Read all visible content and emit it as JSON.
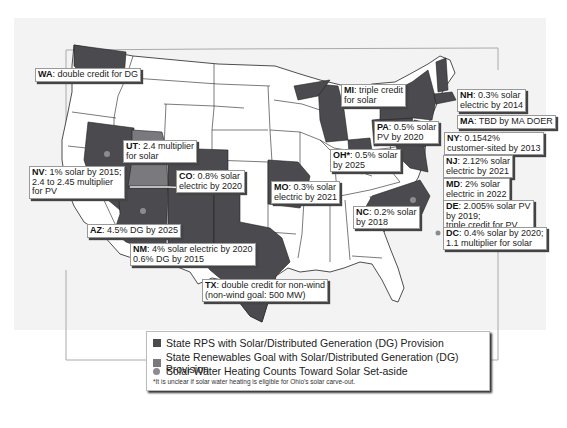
{
  "colors": {
    "rps": "#4a4a4f",
    "goal": "#7a7a7e",
    "swh_dot": "#8c8c90",
    "state_fill": "#ffffff",
    "background": "#f3f3f3"
  },
  "labels": {
    "wa": {
      "code": "WA",
      "text": ": double credit for DG"
    },
    "mi": {
      "code": "MI",
      "text": ": triple credit",
      "text2": "for solar"
    },
    "nh": {
      "code": "NH",
      "text": ": 0.3% solar",
      "text2": "electric by 2014"
    },
    "ma": {
      "code": "MA",
      "text": ": TBD by MA DOER"
    },
    "pa": {
      "code": "PA",
      "text": ": 0.5% solar",
      "text2": "PV by 2020"
    },
    "ny": {
      "code": "NY",
      "text": ": 0.1542%",
      "text2": "customer-sited by 2013"
    },
    "ut": {
      "code": "UT",
      "text": ": 2.4 multiplier",
      "text2": "for solar"
    },
    "nv": {
      "code": "NV",
      "text": ": 1% solar by 2015;",
      "text2": "2.4 to 2.45 multiplier",
      "text3": "for PV"
    },
    "co": {
      "code": "CO",
      "text": ": 0.8% solar",
      "text2": "electric by 2020"
    },
    "oh": {
      "code": "OH*",
      "text": ": 0.5% solar",
      "text2": "by 2025"
    },
    "mo": {
      "code": "MO",
      "text": ": 0.3% solar",
      "text2": "electric by 2021"
    },
    "nj": {
      "code": "NJ",
      "text": ": 2.12% solar",
      "text2": "electric by 2021"
    },
    "md": {
      "code": "MD",
      "text": ": 2% solar",
      "text2": "electric in 2022"
    },
    "de": {
      "code": "DE",
      "text": ": 2.005% solar PV",
      "text2": "by 2019;",
      "text3": "triple credit for PV"
    },
    "dc": {
      "code": "DC",
      "text": ": 0.4% solar by 2020;",
      "text2": "1.1 multiplier for solar"
    },
    "nc": {
      "code": "NC",
      "text": ": 0.2% solar",
      "text2": "by 2018"
    },
    "az": {
      "code": "AZ",
      "text": ": 4.5% DG by 2025"
    },
    "nm": {
      "code": "NM",
      "text": ": 4% solar electric by 2020",
      "text2": "0.6% DG by 2015"
    },
    "tx": {
      "code": "TX",
      "text": ": double credit for non-wind",
      "text2": "(non-wind goal: 500 MW)"
    }
  },
  "legend": {
    "items": [
      {
        "label": "State RPS with Solar/Distributed Generation (DG) Provision"
      },
      {
        "label": "State Renewables Goal with Solar/Distributed Generation (DG) Provision"
      },
      {
        "label": "Solar Water Heating Counts Toward Solar Set-aside"
      }
    ],
    "footnote": "*It is unclear if solar water heating is eligible for Ohio's solar carve-out."
  }
}
